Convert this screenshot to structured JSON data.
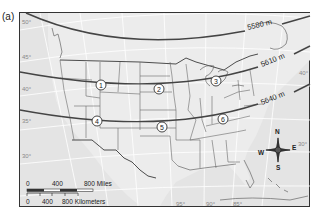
{
  "figure": {
    "panel_label": "(a)"
  },
  "contours": [
    {
      "label": "5580 m",
      "label_x": 250,
      "label_y": 28,
      "rotate": -14
    },
    {
      "label": "5610 m",
      "label_x": 264,
      "label_y": 63,
      "rotate": -22
    },
    {
      "label": "5640 m",
      "label_x": 265,
      "label_y": 101,
      "rotate": -22
    }
  ],
  "markers": [
    {
      "id": "1",
      "label": "1",
      "x": 101,
      "y": 85
    },
    {
      "id": "2",
      "label": "2",
      "x": 159,
      "y": 89
    },
    {
      "id": "3",
      "label": "3",
      "x": 216,
      "y": 81
    },
    {
      "id": "4",
      "label": "4",
      "x": 97,
      "y": 121
    },
    {
      "id": "5",
      "label": "5",
      "x": 162,
      "y": 127
    },
    {
      "id": "6",
      "label": "6",
      "x": 223,
      "y": 119
    }
  ],
  "latitude_labels": [
    {
      "text": "50°",
      "x": 22,
      "y": 24
    },
    {
      "text": "45°",
      "x": 22,
      "y": 59
    },
    {
      "text": "40°",
      "x": 22,
      "y": 91
    },
    {
      "text": "35°",
      "x": 22,
      "y": 123
    },
    {
      "text": "30°",
      "x": 22,
      "y": 158
    },
    {
      "text": "40°",
      "x": 299,
      "y": 75
    },
    {
      "text": "30°",
      "x": 298,
      "y": 146
    }
  ],
  "longitude_labels": [
    {
      "text": "95°",
      "x": 176,
      "y": 208
    },
    {
      "text": "90°",
      "x": 206,
      "y": 208
    },
    {
      "text": "85°",
      "x": 233,
      "y": 208
    }
  ],
  "scale_bar": {
    "miles": {
      "ticks": [
        "0",
        "400",
        "800 Miles"
      ]
    },
    "kilometers": {
      "ticks": [
        "0",
        "400",
        "800 Kilometers"
      ]
    }
  },
  "compass": {
    "north": "N",
    "south": "S",
    "east": "E",
    "west": "W"
  }
}
